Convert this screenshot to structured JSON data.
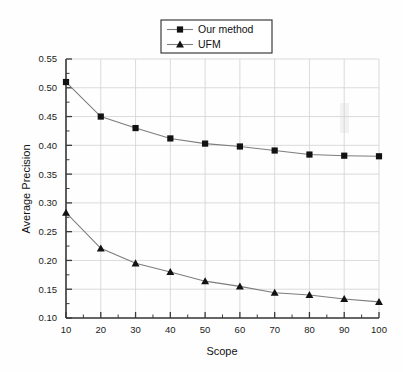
{
  "chart_data": {
    "type": "line",
    "title": "",
    "xlabel": "Scope",
    "ylabel": "Average Precision",
    "x": [
      10,
      20,
      30,
      40,
      50,
      60,
      70,
      80,
      90,
      100
    ],
    "xlim": [
      10,
      100
    ],
    "ylim": [
      0.1,
      0.55
    ],
    "xticks": [
      10,
      20,
      30,
      40,
      50,
      60,
      70,
      80,
      90,
      100
    ],
    "yticks": [
      0.1,
      0.15,
      0.2,
      0.25,
      0.3,
      0.35,
      0.4,
      0.45,
      0.5,
      0.55
    ],
    "xtick_labels": [
      "10",
      "20",
      "30",
      "40",
      "50",
      "60",
      "70",
      "80",
      "90",
      "100"
    ],
    "ytick_labels": [
      "0.10",
      "0.15",
      "0.20",
      "0.25",
      "0.30",
      "0.35",
      "0.40",
      "0.45",
      "0.50",
      "0.55"
    ],
    "grid": true,
    "legend_position": "top-center",
    "series": [
      {
        "name": "Our method",
        "marker": "square",
        "values": [
          0.51,
          0.45,
          0.43,
          0.412,
          0.403,
          0.398,
          0.391,
          0.384,
          0.382,
          0.381
        ]
      },
      {
        "name": "UFM",
        "marker": "triangle",
        "values": [
          0.283,
          0.221,
          0.195,
          0.18,
          0.164,
          0.155,
          0.144,
          0.14,
          0.133,
          0.128
        ]
      }
    ]
  },
  "axes": {
    "x_title": "Scope",
    "y_title": "Average Precision"
  },
  "legend": {
    "entries": [
      {
        "label": "Our method",
        "marker": "square"
      },
      {
        "label": "UFM",
        "marker": "triangle"
      }
    ]
  },
  "colors": {
    "line": "#7d7d7d",
    "marker": "#121212",
    "grid": "#d2d2d2",
    "axis": "#3a3a3a",
    "background": "#fefefe"
  }
}
